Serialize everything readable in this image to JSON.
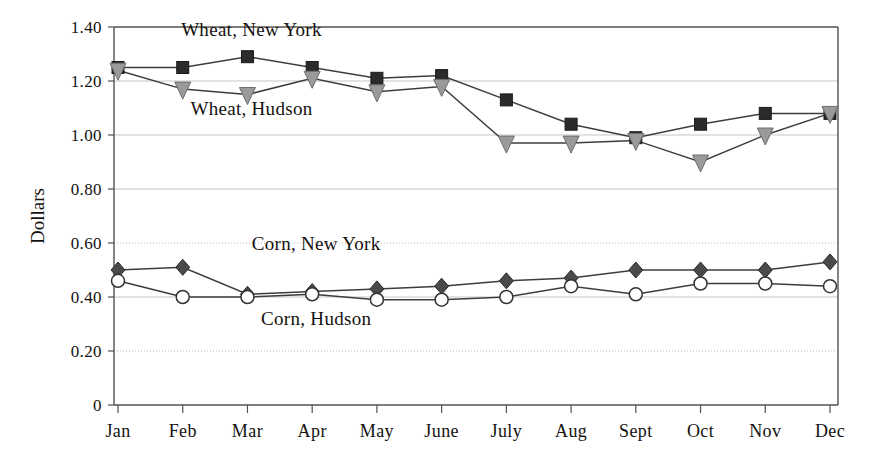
{
  "chart_data": {
    "type": "line",
    "title": "",
    "xlabel": "",
    "ylabel": "Dollars",
    "categories": [
      "Jan",
      "Feb",
      "Mar",
      "Apr",
      "May",
      "June",
      "July",
      "Aug",
      "Sept",
      "Oct",
      "Nov",
      "Dec"
    ],
    "ylim": [
      0,
      1.4
    ],
    "yticks": [
      0,
      0.2,
      0.4,
      0.6,
      0.8,
      1.0,
      1.2,
      1.4
    ],
    "ytick_labels": [
      "0",
      "0.20",
      "0.40",
      "0.60",
      "0.80",
      "1.00",
      "1.20",
      "1.40"
    ],
    "grid": true,
    "legend_position": "inline-annotations",
    "series": [
      {
        "name": "Wheat, New York",
        "marker": "filled-square",
        "color": "#2b2b2b",
        "values": [
          1.25,
          1.25,
          1.29,
          1.25,
          1.21,
          1.22,
          1.13,
          1.04,
          0.99,
          1.04,
          1.08,
          1.08
        ]
      },
      {
        "name": "Wheat, Hudson",
        "marker": "filled-triangle-down",
        "color": "#9a9a9a",
        "values": [
          1.24,
          1.17,
          1.15,
          1.21,
          1.16,
          1.18,
          0.97,
          0.97,
          0.98,
          0.9,
          1.0,
          1.08
        ]
      },
      {
        "name": "Corn, New York",
        "marker": "filled-diamond",
        "color": "#4a4a4a",
        "values": [
          0.5,
          0.51,
          0.41,
          0.42,
          0.43,
          0.44,
          0.46,
          0.47,
          0.5,
          0.5,
          0.5,
          0.53
        ]
      },
      {
        "name": "Corn, Hudson",
        "marker": "open-circle",
        "color": "#ffffff",
        "values": [
          0.46,
          0.4,
          0.4,
          0.41,
          0.39,
          0.39,
          0.4,
          0.44,
          0.41,
          0.45,
          0.45,
          0.44
        ]
      }
    ],
    "annotations": [
      {
        "text": "Wheat, New York",
        "x": "Mar",
        "y": 1.365
      },
      {
        "text": "Wheat, Hudson",
        "x": "Mar",
        "y": 1.075
      },
      {
        "text": "Corn, New York",
        "x": "Apr",
        "y": 0.575
      },
      {
        "text": "Corn, Hudson",
        "x": "Apr",
        "y": 0.295
      }
    ]
  },
  "axis": {
    "y_title": "Dollars",
    "y_labels": [
      "1.40",
      "1.20",
      "1.00",
      "0.80",
      "0.60",
      "0.40",
      "0.20",
      "0"
    ],
    "x_labels": [
      "Jan",
      "Feb",
      "Mar",
      "Apr",
      "May",
      "June",
      "July",
      "Aug",
      "Sept",
      "Oct",
      "Nov",
      "Dec"
    ]
  },
  "labels": {
    "wheat_ny": "Wheat, New York",
    "wheat_hudson": "Wheat, Hudson",
    "corn_ny": "Corn, New York",
    "corn_hudson": "Corn, Hudson"
  }
}
